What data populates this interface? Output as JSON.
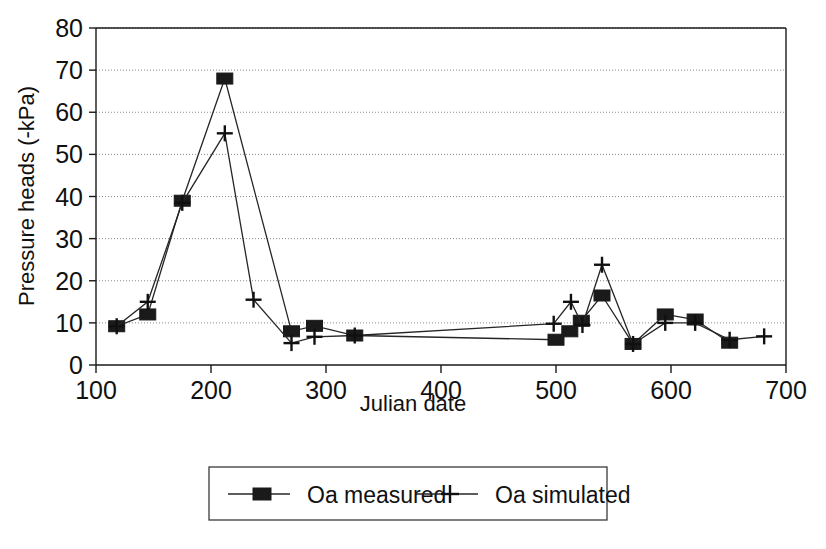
{
  "chart_data": {
    "type": "line",
    "title": "",
    "subtitle": "",
    "xlabel": "Julian date",
    "ylabel": "Pressure heads (-kPa)",
    "xlim": [
      100,
      700
    ],
    "ylim": [
      0,
      80
    ],
    "xticks": [
      100,
      200,
      300,
      400,
      500,
      600,
      700
    ],
    "xtick_labels": [
      "100",
      "200",
      "300",
      "400",
      "500",
      "600",
      "700"
    ],
    "yticks": [
      0,
      10,
      20,
      30,
      40,
      50,
      60,
      70,
      80
    ],
    "ytick_labels": [
      "0",
      "10",
      "20",
      "30",
      "40",
      "50",
      "60",
      "70",
      "80"
    ],
    "grid": "horizontal-dotted",
    "legend_position": "below-plot",
    "series": [
      {
        "name": "Oa measured",
        "marker": "filled-square",
        "color": "#1a1a1a",
        "x": [
          118,
          145,
          175,
          212,
          270,
          290,
          325,
          500,
          512,
          522,
          540,
          567,
          595,
          621,
          651
        ],
        "y": [
          9.2,
          12.0,
          39.0,
          68.0,
          8.0,
          9.3,
          7.0,
          6.0,
          8.0,
          10.5,
          16.5,
          5.0,
          12.0,
          10.8,
          5.3
        ]
      },
      {
        "name": "Oa simulated",
        "marker": "plus",
        "color": "#101010",
        "x": [
          118,
          145,
          175,
          212,
          237,
          270,
          290,
          325,
          498,
          513,
          523,
          540,
          567,
          595,
          621,
          651,
          681
        ],
        "y": [
          9.2,
          15.0,
          38.5,
          55.0,
          15.5,
          5.2,
          6.7,
          7.0,
          9.8,
          15.0,
          9.5,
          23.8,
          5.0,
          10.0,
          10.0,
          6.0,
          6.8
        ]
      }
    ]
  },
  "legend": {
    "items": [
      {
        "label": "Oa measured",
        "marker": "filled-square"
      },
      {
        "label": "Oa simulated",
        "marker": "plus"
      }
    ]
  }
}
